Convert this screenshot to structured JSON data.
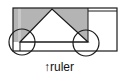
{
  "diagram": {
    "label": {
      "arrow": "↑",
      "text": "ruler"
    },
    "colors": {
      "stroke": "#1a1a1a",
      "fill_gray": "#b4b4b4",
      "fill_gray_light": "#c8c8c8",
      "background": "#ffffff"
    },
    "shapes": {
      "outer_rect": {
        "x": 13,
        "y": 8,
        "w": 104,
        "h": 43
      },
      "gray_region": {
        "x": 13,
        "y": 8,
        "w": 75,
        "h": 34
      },
      "triangle_peak": {
        "x": 52,
        "y": 9
      },
      "left_circle": {
        "cx": 22,
        "cy": 42,
        "r": 13
      },
      "right_circle": {
        "cx": 86,
        "cy": 43,
        "r": 13
      }
    }
  }
}
